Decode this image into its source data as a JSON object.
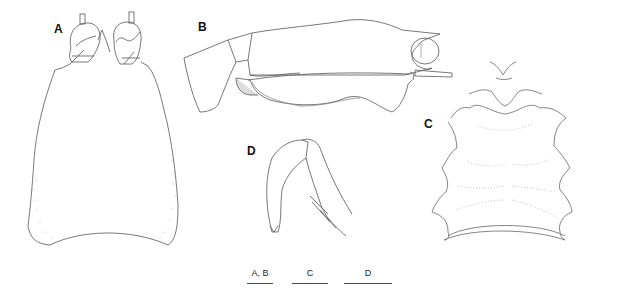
{
  "figure": {
    "panels": [
      {
        "id": "A",
        "label": "A",
        "description": "cephalothorax, dorsal view with eyes"
      },
      {
        "id": "B",
        "label": "B",
        "description": "cephalothorax, lateral view"
      },
      {
        "id": "C",
        "label": "C",
        "description": "abdominal segments, dorsal view"
      },
      {
        "id": "D",
        "label": "D",
        "description": "appendage detail"
      }
    ],
    "scale_bars": [
      {
        "label": "A, B"
      },
      {
        "label": "C"
      },
      {
        "label": "D"
      }
    ],
    "line_color": "#555555",
    "stipple_color": "#aaaaaa"
  }
}
